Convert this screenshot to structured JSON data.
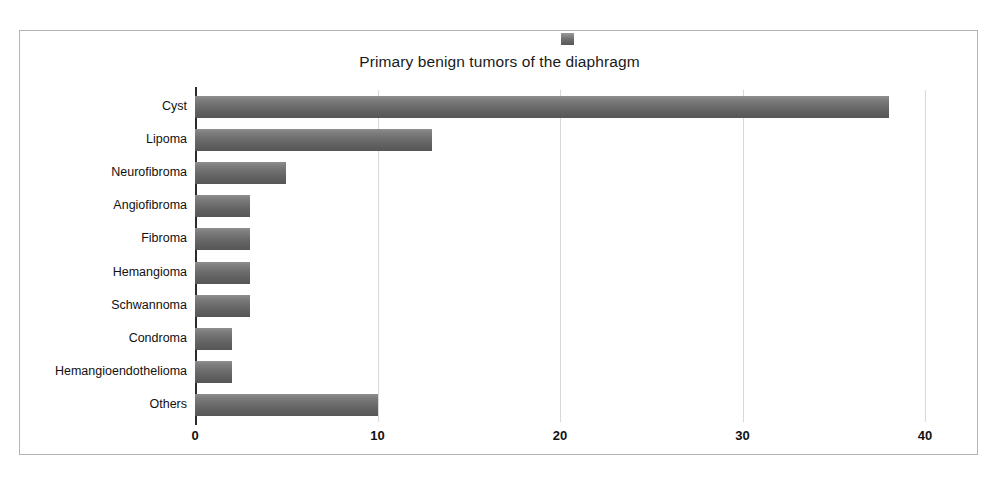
{
  "chart_data": {
    "type": "bar",
    "orientation": "horizontal",
    "title": "Primary benign tumors of the diaphragm",
    "xlabel": "",
    "ylabel": "",
    "xlim": [
      0,
      40
    ],
    "xticks": [
      0,
      10,
      20,
      30,
      40
    ],
    "grid": true,
    "legend": {
      "position": "top",
      "entries": [
        {
          "label": "",
          "color": "#6d6d6d",
          "marker": "square"
        }
      ]
    },
    "categories": [
      "Cyst",
      "Lipoma",
      "Neurofibroma",
      "Angiofibroma",
      "Fibroma",
      "Hemangioma",
      "Schwannoma",
      "Condroma",
      "Hemangioendothelioma",
      "Others"
    ],
    "values": [
      38,
      13,
      5,
      3,
      3,
      3,
      3,
      2,
      2,
      10
    ],
    "bar_color": "#6d6d6d"
  },
  "frame": {
    "border_color": "#b3b3b3",
    "background": "#ffffff"
  }
}
